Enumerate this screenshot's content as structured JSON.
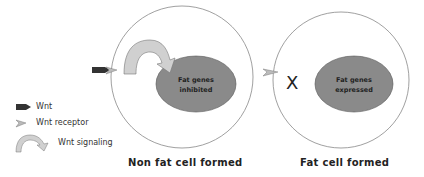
{
  "diagram": {
    "left_cell": {
      "nucleus_label_line1": "Fat genes",
      "nucleus_label_line2": "inhibited",
      "caption": "Non fat cell formed"
    },
    "right_cell": {
      "nucleus_label_line1": "Fat genes",
      "nucleus_label_line2": "expressed",
      "blocked_mark": "X",
      "caption": "Fat cell formed"
    },
    "legend": [
      {
        "icon": "wnt-ligand-icon",
        "label": "Wnt"
      },
      {
        "icon": "wnt-receptor-icon",
        "label": "Wnt receptor"
      },
      {
        "icon": "wnt-signaling-arrow-icon",
        "label": "Wnt signaling"
      }
    ],
    "colors": {
      "nucleus_fill": "#8a8a8a",
      "cell_outline": "#888888",
      "wnt_ligand": "#333333",
      "arrow_fill": "#d0d0d0"
    }
  }
}
